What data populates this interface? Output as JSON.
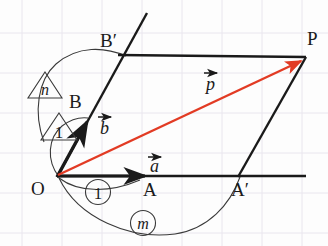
{
  "figure": {
    "background_color": "#fdfdfd",
    "grid_color": "#e9e6ee",
    "ink_color": "#1a1a1a",
    "accent_color": "#e23b24",
    "width": 328,
    "height": 246
  },
  "points": {
    "O": {
      "label": "O",
      "x": 57,
      "y": 176,
      "label_x": 31,
      "label_y": 195
    },
    "A": {
      "label": "A",
      "x": 150,
      "y": 176,
      "label_x": 143,
      "label_y": 196
    },
    "A_prime": {
      "label": "A′",
      "x": 240,
      "y": 176,
      "label_x": 231,
      "label_y": 196
    },
    "B": {
      "label": "B",
      "x": 90,
      "y": 118,
      "label_x": 69,
      "label_y": 108
    },
    "B_prime": {
      "label": "B′",
      "x": 124,
      "y": 55,
      "label_x": 100,
      "label_y": 47
    },
    "P": {
      "label": "P",
      "x": 305,
      "y": 57,
      "label_x": 307,
      "label_y": 45
    }
  },
  "vectors": [
    {
      "name": "a",
      "label": "a",
      "from": "O",
      "to": "A",
      "color": "#1a1a1a",
      "label_x": 152,
      "label_y": 166
    },
    {
      "name": "b",
      "label": "b",
      "from": "O",
      "to": "B",
      "color": "#1a1a1a",
      "label_x": 101,
      "label_y": 130
    },
    {
      "name": "p",
      "label": "p",
      "from": "O",
      "to": "P",
      "color": "#e23b24",
      "label_x": 208,
      "label_y": 90
    }
  ],
  "badges": [
    {
      "name": "scale-n",
      "shape": "triangle",
      "text": "n",
      "cx": 45,
      "cy": 86
    },
    {
      "name": "scale-1-vertical",
      "shape": "triangle",
      "text": "1",
      "cx": 59,
      "cy": 128
    },
    {
      "name": "scale-1-horizontal",
      "shape": "circle",
      "text": "1",
      "cx": 98,
      "cy": 192
    },
    {
      "name": "scale-m",
      "shape": "circle",
      "text": "m",
      "cx": 143,
      "cy": 223
    }
  ],
  "arcs": [
    {
      "name": "arc-m-scaling",
      "description": "arc from A to A′ through circled m"
    },
    {
      "name": "arc-n-scaling",
      "description": "arc from B to B′ through triangled n"
    }
  ],
  "lines": [
    {
      "name": "axis-a-extended",
      "description": "horizontal baseline through O, A, A′ extended right"
    },
    {
      "name": "axis-b-extended",
      "description": "steep line through O, B, B′ extended up"
    },
    {
      "name": "edge-bprime-p",
      "description": "segment from B′ to P"
    },
    {
      "name": "edge-aprime-p",
      "description": "segment from A′ to P"
    }
  ]
}
